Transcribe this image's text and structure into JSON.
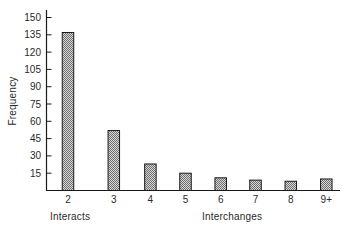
{
  "chart_data": {
    "type": "bar",
    "title": "",
    "xlabel": "Interchanges",
    "xlabel_left": "Interacts",
    "ylabel": "Frequency",
    "categories": [
      "2",
      "3",
      "4",
      "5",
      "6",
      "7",
      "8",
      "9+"
    ],
    "values": [
      137,
      52,
      23,
      15,
      11,
      9,
      8,
      10
    ],
    "yticks": [
      15,
      30,
      45,
      60,
      75,
      90,
      105,
      120,
      135,
      150
    ],
    "ylim": [
      0,
      150
    ],
    "grid": false,
    "legend": null,
    "bar_fill": "crosshatch-gray"
  },
  "colors": {
    "axis": "#1a1a1a",
    "bar_stroke": "#1a1a1a",
    "bar_fill_light": "#d8d8d8",
    "bar_fill_dark": "#6e6e6e",
    "text": "#2a2a2a"
  }
}
